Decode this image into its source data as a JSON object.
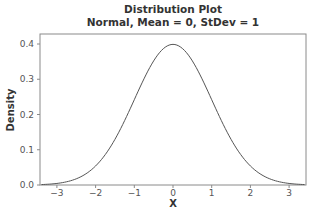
{
  "chart_data": {
    "type": "line",
    "title": "Distribution Plot",
    "subtitle": "Normal, Mean = 0, StDev = 1",
    "xlabel": "X",
    "ylabel": "Density",
    "xlim": [
      -3.42,
      3.42
    ],
    "ylim": [
      0.0,
      0.43
    ],
    "x_ticks": [
      -3,
      -2,
      -1,
      0,
      1,
      2,
      3
    ],
    "x_tick_labels": [
      "−3",
      "−2",
      "−1",
      "0",
      "1",
      "2",
      "3"
    ],
    "y_ticks": [
      0.0,
      0.1,
      0.2,
      0.3,
      0.4
    ],
    "y_tick_labels": [
      "0.0",
      "0.1",
      "0.2",
      "0.3",
      "0.4"
    ],
    "grid": false,
    "legend": null,
    "series": [
      {
        "name": "Normal(0,1) density",
        "distribution": "normal",
        "mean": 0,
        "stdev": 1,
        "x": [
          -3.4,
          -3.0,
          -2.5,
          -2.0,
          -1.5,
          -1.0,
          -0.5,
          0.0,
          0.5,
          1.0,
          1.5,
          2.0,
          2.5,
          3.0,
          3.4
        ],
        "values": [
          0.0012,
          0.0044,
          0.0175,
          0.054,
          0.1295,
          0.242,
          0.3521,
          0.3989,
          0.3521,
          0.242,
          0.1295,
          0.054,
          0.0175,
          0.0044,
          0.0012
        ]
      }
    ]
  },
  "colors": {
    "curve": "#555555",
    "frame": "#888888",
    "text": "#333333"
  }
}
